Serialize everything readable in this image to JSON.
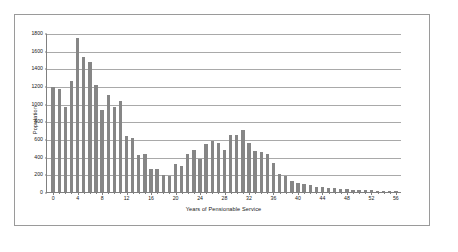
{
  "chart_data": {
    "type": "bar",
    "title": "",
    "xlabel": "Years of Pensionable Service",
    "ylabel": "Population",
    "ylim": [
      0,
      1800
    ],
    "ytick_step": 200,
    "yticks": [
      0,
      200,
      400,
      600,
      800,
      1000,
      1200,
      1400,
      1600,
      1800
    ],
    "xlim": [
      -1,
      57
    ],
    "xticks": [
      0,
      4,
      8,
      12,
      16,
      20,
      24,
      28,
      32,
      36,
      40,
      44,
      48,
      52,
      56
    ],
    "grid": "horizontal",
    "legend": "none",
    "bar_color": "#868686",
    "categories": [
      0,
      1,
      2,
      3,
      4,
      5,
      6,
      7,
      8,
      9,
      10,
      11,
      12,
      13,
      14,
      15,
      16,
      17,
      18,
      19,
      20,
      21,
      22,
      23,
      24,
      25,
      26,
      27,
      28,
      29,
      30,
      31,
      32,
      33,
      34,
      35,
      36,
      37,
      38,
      39,
      40,
      41,
      42,
      43,
      44,
      45,
      46,
      47,
      48,
      49,
      50,
      51,
      52,
      53,
      54,
      55,
      56
    ],
    "values": [
      1190,
      1165,
      960,
      1255,
      1745,
      1525,
      1475,
      1210,
      930,
      1095,
      965,
      1030,
      630,
      615,
      420,
      425,
      255,
      265,
      190,
      185,
      320,
      300,
      435,
      470,
      375,
      545,
      580,
      560,
      470,
      640,
      650,
      700,
      555,
      460,
      450,
      430,
      330,
      200,
      180,
      130,
      100,
      95,
      75,
      60,
      55,
      45,
      40,
      35,
      30,
      28,
      25,
      20,
      18,
      15,
      12,
      8,
      6
    ]
  }
}
